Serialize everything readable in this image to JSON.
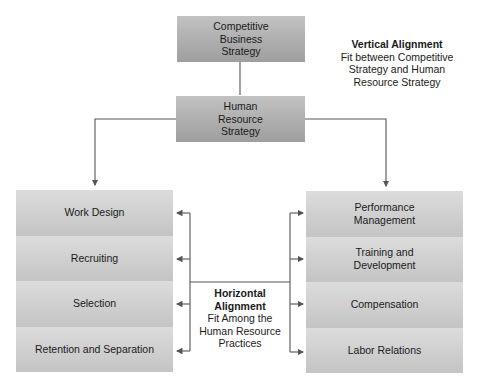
{
  "top_box": {
    "lines": [
      "Competitive",
      "Business",
      "Strategy"
    ]
  },
  "hr_box": {
    "lines": [
      "Human",
      "Resource",
      "Strategy"
    ]
  },
  "vertical_alignment": {
    "title": "Vertical Alignment",
    "lines": [
      "Fit between Competitive",
      "Strategy and Human",
      "Resource Strategy"
    ]
  },
  "horizontal_alignment": {
    "title_lines": [
      "Horizontal",
      "Alignment"
    ],
    "lines": [
      "Fit Among the",
      "Human Resource",
      "Practices"
    ]
  },
  "left_practices": [
    {
      "lines": [
        "Work Design"
      ]
    },
    {
      "lines": [
        "Recruiting"
      ]
    },
    {
      "lines": [
        "Selection"
      ]
    },
    {
      "lines": [
        "Retention and Separation"
      ]
    }
  ],
  "right_practices": [
    {
      "lines": [
        "Performance",
        "Management"
      ]
    },
    {
      "lines": [
        "Training and",
        "Development"
      ]
    },
    {
      "lines": [
        "Compensation"
      ]
    },
    {
      "lines": [
        "Labor Relations"
      ]
    }
  ],
  "colors": {
    "connector": "#555555",
    "dark_box": "#b0b0b0",
    "light_box": "#d0d0d0"
  }
}
